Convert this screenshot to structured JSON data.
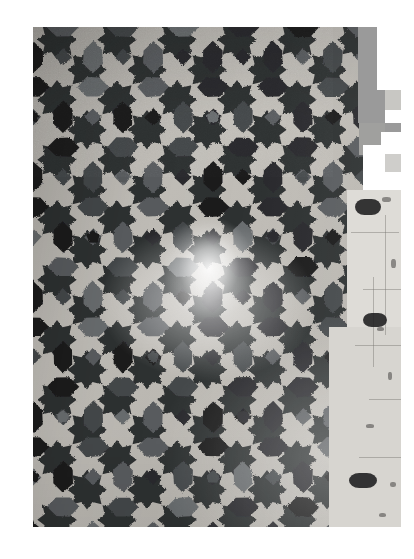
{
  "image": {
    "kind": "photograph",
    "subject": "islamic-zellige-tile-mosaic",
    "orientation": "portrait",
    "color_mode": "grayscale",
    "canvas": {
      "width": 414,
      "height": 559,
      "background": "#ffffff"
    },
    "photo_frame": {
      "left": 33,
      "top": 27,
      "width": 368,
      "height": 500
    }
  },
  "palette": {
    "page_background": "#ffffff",
    "mortar_light": "#c5c2bc",
    "mortar_mid": "#b2afa9",
    "mortar_shadow": "#9b9893",
    "tile_black": "#1d1d1e",
    "tile_dark": "#2b2c2e",
    "tile_slate": "#45484b",
    "tile_gray": "#5a5d60",
    "tile_mid_gray": "#6b6e70",
    "glare_white": "#f4f2ee",
    "artifact_gray": "#9a9a9a",
    "artifact_light_gray": "#c8c7c3",
    "artifact_pale": "#dedcd7",
    "artifact_white": "#ffffff"
  },
  "pattern": {
    "name": "eight-pointed-star-and-rosette",
    "repeat_px": 60,
    "columns": 7,
    "rows": 9,
    "motifs": [
      "eight-pointed-star",
      "elongated-hexagon-lozenge",
      "safsafa-petal",
      "square-cross",
      "kite"
    ],
    "tile_shade_sequence": [
      "tile_black",
      "tile_slate",
      "tile_dark",
      "tile_gray",
      "tile_mid_gray"
    ],
    "mortar_joint_width_px": 4
  },
  "glare": {
    "label": "specular-highlight",
    "center_x": 176,
    "center_y": 241,
    "radius_x": 46,
    "radius_y": 52,
    "intensity": 0.9
  },
  "artifact_region": {
    "label": "stepped-blocky-overlay-right-edge",
    "description": "rectangular gray and white blocks stepping down the right side of the photograph",
    "blocks": [
      {
        "name": "gray-block-top",
        "x": 325,
        "y": 0,
        "w": 43,
        "h": 96,
        "color": "#9a9a9a"
      },
      {
        "name": "white-block-top-right",
        "x": 344,
        "y": 0,
        "w": 24,
        "h": 63,
        "color": "#ffffff"
      },
      {
        "name": "gray-block-upper",
        "x": 326,
        "y": 96,
        "w": 26,
        "h": 32,
        "color": "#a0a09e"
      },
      {
        "name": "lightgray-strip-a",
        "x": 352,
        "y": 63,
        "w": 16,
        "h": 20,
        "color": "#c8c7c3"
      },
      {
        "name": "white-strip-a",
        "x": 352,
        "y": 83,
        "w": 16,
        "h": 13,
        "color": "#ffffff"
      },
      {
        "name": "gray-strip-b",
        "x": 352,
        "y": 96,
        "w": 16,
        "h": 22,
        "color": "#9a9a9a"
      },
      {
        "name": "white-block-mid",
        "x": 330,
        "y": 118,
        "w": 24,
        "h": 32,
        "color": "#ffffff"
      },
      {
        "name": "white-block-mid-b",
        "x": 348,
        "y": 105,
        "w": 20,
        "h": 22,
        "color": "#ffffff"
      },
      {
        "name": "lightgray-block-mid",
        "x": 352,
        "y": 127,
        "w": 16,
        "h": 18,
        "color": "#cfcecb"
      },
      {
        "name": "white-block-mid-c",
        "x": 330,
        "y": 145,
        "w": 38,
        "h": 18,
        "color": "#ffffff"
      },
      {
        "name": "pale-band-right",
        "x": 314,
        "y": 163,
        "w": 54,
        "h": 337,
        "color": "#dedcd7"
      },
      {
        "name": "pale-band-lower",
        "x": 296,
        "y": 300,
        "w": 72,
        "h": 200,
        "color": "#d7d5d0"
      }
    ]
  },
  "accessibility": {
    "alt_text": "Black and white photograph of an Islamic zellige tile mosaic wall with an eight-pointed star pattern, a bright glare in the centre and pale blocky artifacts along the right edge."
  }
}
